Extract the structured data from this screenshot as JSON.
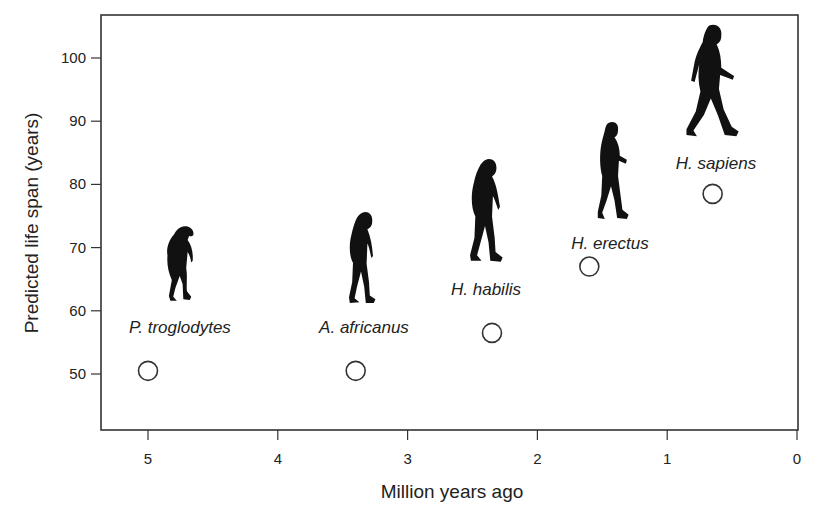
{
  "chart_data": {
    "type": "scatter",
    "title": "",
    "xlabel": "Million years ago",
    "ylabel": "Predicted life span (years)",
    "xlim": [
      5.35,
      0
    ],
    "ylim": [
      41,
      106
    ],
    "x_reversed": true,
    "grid": false,
    "legend": "none",
    "x_ticks": [
      5,
      4,
      3,
      2,
      1,
      0
    ],
    "x_tick_labels": [
      "5",
      "4",
      "3",
      "2",
      "1",
      "0"
    ],
    "y_ticks": [
      100,
      90,
      80,
      70,
      60,
      50
    ],
    "y_tick_labels": [
      "100",
      "90",
      "80",
      "70",
      "60",
      "50"
    ],
    "marker": "open-circle",
    "points": [
      {
        "label": "P. troglodytes",
        "x": 5.0,
        "y": 50.5,
        "figure": "chimpanzee-silhouette"
      },
      {
        "label": "A. africanus",
        "x": 3.4,
        "y": 50.5,
        "figure": "australopithecus-silhouette"
      },
      {
        "label": "H. habilis",
        "x": 2.35,
        "y": 56.5,
        "figure": "habilis-silhouette"
      },
      {
        "label": "H. erectus",
        "x": 1.6,
        "y": 67,
        "figure": "erectus-silhouette"
      },
      {
        "label": "H. sapiens",
        "x": 0.65,
        "y": 78.5,
        "figure": "sapiens-silhouette"
      }
    ]
  },
  "colors": {
    "frame": "#333333",
    "text": "#222222",
    "marker_stroke": "#333333",
    "silhouette": "#111111",
    "background": "#ffffff"
  }
}
